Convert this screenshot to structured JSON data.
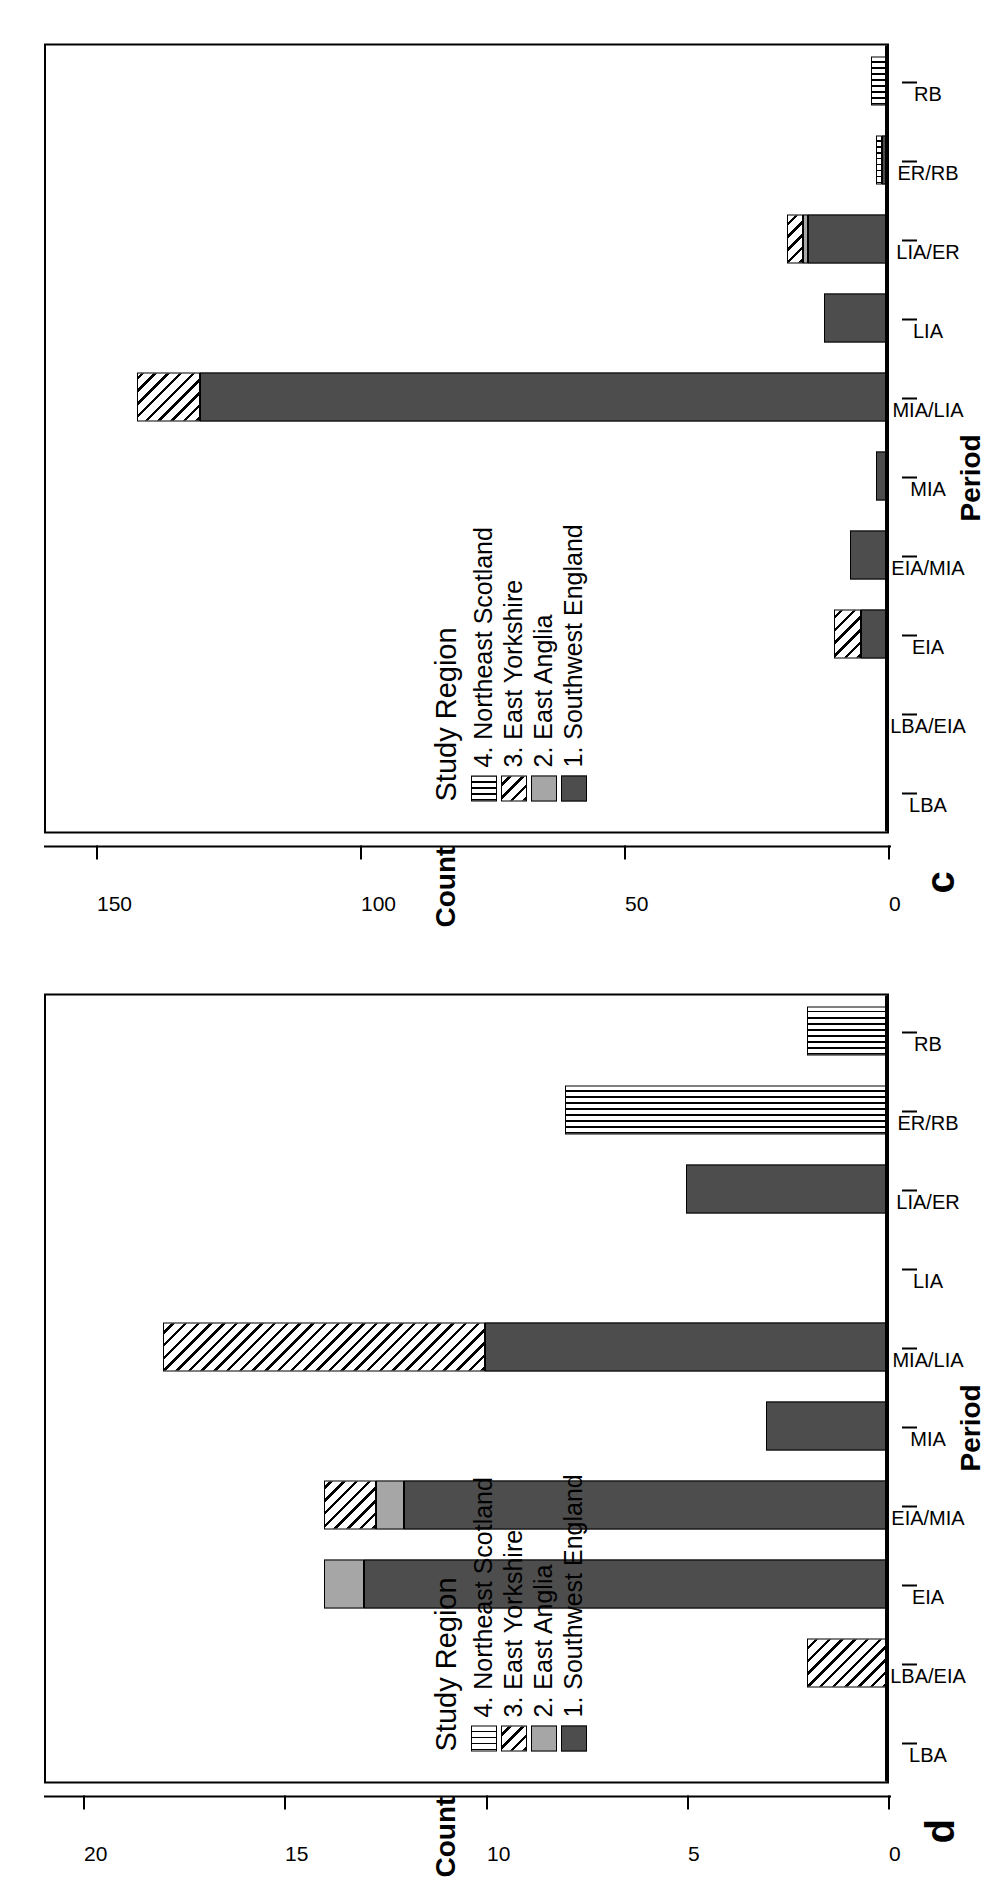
{
  "figure": {
    "orientation": "rotated-90-ccw",
    "panels": [
      {
        "letter": "d"
      },
      {
        "letter": "c"
      }
    ]
  },
  "legend": {
    "title": "Study Region",
    "entries": [
      {
        "label": "4. Northeast Scotland",
        "pattern": "vertical-stripes",
        "color": "#ffffff"
      },
      {
        "label": "3. East Yorkshire",
        "pattern": "diagonal-hatch",
        "color": "#ffffff"
      },
      {
        "label": "2. East Anglia",
        "pattern": "solid",
        "color": "#a6a6a6"
      },
      {
        "label": "1. Southwest England",
        "pattern": "solid",
        "color": "#4d4d4d"
      }
    ]
  },
  "axes": {
    "x_title": "Period",
    "y_title": "Count"
  },
  "chart_data": [
    {
      "panel": "d",
      "type": "bar",
      "title": "",
      "xlabel": "Period",
      "ylabel": "Count",
      "grid": false,
      "legend_position": "inside-left",
      "orientation": "vertical-stacked",
      "ylim": [
        0,
        21
      ],
      "yticks": [
        "0",
        "5",
        "10",
        "15",
        "20"
      ],
      "ytick_values": [
        0,
        5,
        10,
        15,
        20
      ],
      "categories": [
        "LBA",
        "LBA/EIA",
        "EIA",
        "EIA/MIA",
        "MIA",
        "MIA/LIA",
        "LIA",
        "LIA/ER",
        "ER/RB",
        "RB"
      ],
      "series": [
        {
          "name": "1. Southwest England",
          "values": [
            0,
            0,
            13,
            12,
            3,
            10,
            0,
            5,
            0,
            0
          ]
        },
        {
          "name": "2. East Anglia",
          "values": [
            0,
            0,
            1,
            0.7,
            0,
            0,
            0,
            0,
            0,
            0
          ]
        },
        {
          "name": "3. East Yorkshire",
          "values": [
            0,
            2,
            0,
            1.3,
            0,
            8,
            0,
            0,
            0,
            0
          ]
        },
        {
          "name": "4. Northeast Scotland",
          "values": [
            0,
            0,
            0,
            0,
            0,
            0,
            0,
            0,
            8,
            2
          ]
        }
      ],
      "totals": [
        0,
        2,
        14,
        14,
        3,
        18,
        0,
        5,
        8,
        2
      ]
    },
    {
      "panel": "c",
      "type": "bar",
      "title": "",
      "xlabel": "Period",
      "ylabel": "Count",
      "grid": false,
      "legend_position": "inside-left",
      "orientation": "vertical-stacked",
      "ylim": [
        0,
        160
      ],
      "yticks": [
        "0",
        "50",
        "100",
        "150"
      ],
      "ytick_values": [
        0,
        50,
        100,
        150
      ],
      "categories": [
        "LBA",
        "LBA/EIA",
        "EIA",
        "EIA/MIA",
        "MIA",
        "MIA/LIA",
        "LIA",
        "LIA/ER",
        "ER/RB",
        "RB"
      ],
      "series": [
        {
          "name": "1. Southwest England",
          "values": [
            0,
            0,
            5,
            7,
            2,
            130,
            12,
            15,
            1,
            0
          ]
        },
        {
          "name": "2. East Anglia",
          "values": [
            0,
            0,
            0,
            0,
            0,
            0,
            0,
            1,
            0,
            0
          ]
        },
        {
          "name": "3. East Yorkshire",
          "values": [
            0,
            0,
            5,
            0,
            0,
            12,
            0,
            3,
            0,
            0
          ]
        },
        {
          "name": "4. Northeast Scotland",
          "values": [
            0,
            0,
            0,
            0,
            0,
            0,
            0,
            0,
            1,
            3
          ]
        }
      ],
      "totals": [
        0,
        0,
        10,
        7,
        2,
        142,
        12,
        19,
        2,
        3
      ]
    }
  ]
}
